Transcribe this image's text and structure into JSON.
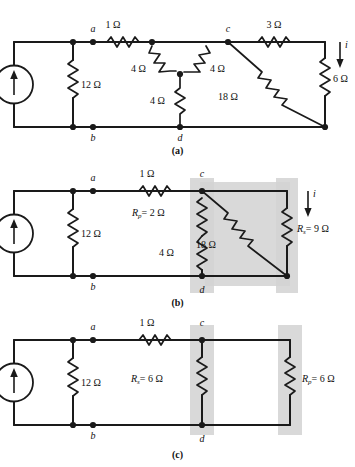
{
  "figure": {
    "title_caption_a": "(a)",
    "title_caption_b": "(b)",
    "title_caption_c": "(c)"
  },
  "panel_a": {
    "caption": "(a)",
    "source_label": "4 A",
    "node_a": "a",
    "node_b": "b",
    "node_c": "c",
    "node_d": "d",
    "current_label": "i",
    "r_12": "12 Ω",
    "r_1": "1 Ω",
    "r_4_left": "4 Ω",
    "r_4_right": "4 Ω",
    "r_4_bottom": "4 Ω",
    "r_3": "3 Ω",
    "r_18": "18 Ω",
    "r_6": "6 Ω"
  },
  "panel_b": {
    "caption": "(b)",
    "source_label": "4 A",
    "node_a": "a",
    "node_b": "b",
    "node_c": "c",
    "node_d": "d",
    "current_label": "i",
    "r_12": "12 Ω",
    "r_1": "1 Ω",
    "rp_label": "R",
    "rp_sub": "p",
    "rp_value": "= 2 Ω",
    "r_4": "4 Ω",
    "r_18": "18 Ω",
    "rs_label": "R",
    "rs_sub": "s",
    "rs_value": "= 9 Ω"
  },
  "panel_c": {
    "caption": "(c)",
    "source_label": "4 A",
    "node_a": "a",
    "node_b": "b",
    "node_c": "c",
    "node_d": "d",
    "r_12": "12 Ω",
    "r_1": "1 Ω",
    "rs_label": "R",
    "rs_sub": "s",
    "rs_value": "= 6 Ω",
    "rp_label": "R",
    "rp_sub": "p",
    "rp_value": "= 6 Ω"
  },
  "colors": {
    "ink": "#1a1a1a",
    "highlight": "#d2d2d2",
    "background": "#ffffff"
  }
}
